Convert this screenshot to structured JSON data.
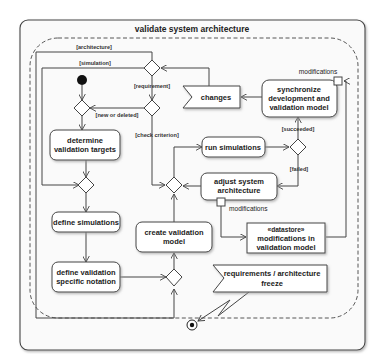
{
  "diagram": {
    "title": "validate system architecture",
    "actions": {
      "determine_targets": [
        "determine",
        "validation targets"
      ],
      "define_simulations": [
        "define simulations"
      ],
      "define_notation": [
        "define validation",
        "specific notation"
      ],
      "create_model": [
        "create validation",
        "model"
      ],
      "run_simulations": [
        "run simulations"
      ],
      "adjust_architecture": [
        "adjust system",
        "architecture"
      ],
      "synchronize": [
        "synchronize",
        "development and",
        "validation model"
      ]
    },
    "signals": {
      "changes": "changes",
      "freeze": [
        "requirements / architecture",
        "freeze"
      ]
    },
    "datastore": [
      "«datastore»",
      "modifications in",
      "validation model"
    ],
    "pins": {
      "sync_pin_label": "modifications",
      "adjust_pin_label": "modifications"
    },
    "guards": {
      "architecture": "[architecture]",
      "simulation": "[simulation]",
      "requirement": "[requirement]",
      "new_or_deleted": "[new or deleted]",
      "check_criterion": "[check criterion]",
      "succeeded": "[succeeded]",
      "failed": "[failed]"
    },
    "colors": {
      "stroke": "#444444",
      "fill": "#ffffff",
      "frame_bg": "#fafafa",
      "shadow": "#bdbdbd"
    }
  }
}
